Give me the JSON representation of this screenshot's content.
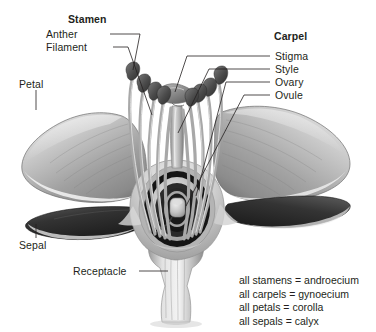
{
  "figure": {
    "background_color": "#ffffff",
    "text_color": "#231f20"
  },
  "labels": {
    "stamen": "Stamen",
    "anther": "Anther",
    "filament": "Filament",
    "petal": "Petal",
    "sepal": "Sepal",
    "receptacle": "Receptacle",
    "carpel": "Carpel",
    "stigma": "Stigma",
    "style": "Style",
    "ovary": "Ovary",
    "ovule": "Ovule"
  },
  "legend": {
    "lines": [
      "all stamens = androecium",
      "all carpels = gynoecium",
      "all petals = corolla",
      "all sepals = calyx"
    ]
  },
  "parts": {
    "petal_left": "petal-left",
    "petal_right": "petal-right",
    "sepal_left": "sepal-left",
    "sepal_right": "sepal-right",
    "stamens_count": 10,
    "ovule": "ovule",
    "ovary": "ovary",
    "style": "style",
    "stigma": "stigma",
    "receptacle": "receptacle"
  }
}
